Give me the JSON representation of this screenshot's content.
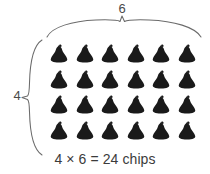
{
  "diagram": {
    "type": "array-model",
    "title_caption": "4 × 6 = 24 chips",
    "background_color": "#ffffff",
    "chip_color": "#1a1a1a",
    "brace_color": "#6b6b6b",
    "label_color": "#4a4a4a",
    "rows": 4,
    "columns": 6,
    "total": 24,
    "item_name": "chips",
    "row_label": "4",
    "column_label": "6",
    "icon_name": "chocolate-chip-icon",
    "top_brace_name": "column-brace",
    "left_brace_name": "row-brace",
    "grid": [
      [
        "chip",
        "chip",
        "chip",
        "chip",
        "chip",
        "chip"
      ],
      [
        "chip",
        "chip",
        "chip",
        "chip",
        "chip",
        "chip"
      ],
      [
        "chip",
        "chip",
        "chip",
        "chip",
        "chip",
        "chip"
      ],
      [
        "chip",
        "chip",
        "chip",
        "chip",
        "chip",
        "chip"
      ]
    ]
  },
  "chart_data": {
    "type": "bar",
    "title": "4 × 6 = 24 chips",
    "categories": [
      "Row 1",
      "Row 2",
      "Row 3",
      "Row 4"
    ],
    "values": [
      6,
      6,
      6,
      6
    ],
    "xlabel": "6",
    "ylabel": "4",
    "ylim": [
      0,
      6
    ]
  }
}
